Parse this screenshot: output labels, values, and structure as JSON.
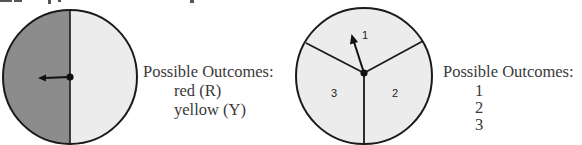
{
  "spinners": [
    {
      "id": "two-color",
      "sections": [
        {
          "label": "",
          "color": "#8c8c8c",
          "name": "red"
        },
        {
          "label": "",
          "color": "#ececec",
          "name": "yellow"
        }
      ],
      "pointer_on": "red",
      "outcomes_heading": "Possible Outcomes:",
      "outcomes": [
        "red (R)",
        "yellow (Y)"
      ]
    },
    {
      "id": "three-number",
      "sections": [
        {
          "label": "1",
          "color": "#ececec"
        },
        {
          "label": "2",
          "color": "#ececec"
        },
        {
          "label": "3",
          "color": "#ececec"
        }
      ],
      "pointer_on": "1",
      "outcomes_heading": "Possible Outcomes:",
      "outcomes": [
        "1",
        "2",
        "3"
      ]
    }
  ],
  "colors": {
    "outline": "#1a1a1a",
    "text": "#3a3a3a"
  }
}
